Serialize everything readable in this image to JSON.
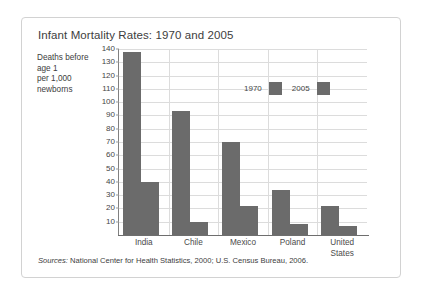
{
  "figure": {
    "title": "Infant Mortality Rates: 1970 and 2005",
    "axis_label_lines": [
      "Deaths before",
      "age 1",
      "per 1,000",
      "newborns"
    ],
    "sources": {
      "label": "Sources:",
      "text": " National Center for Health Statistics, 2000; U.S. Census Bureau, 2006."
    },
    "colors": {
      "bar_fill": "#6b6b6b",
      "gridline": "#dcdcdc",
      "axis_line": "#6e6e6e",
      "frame_border": "#d2d2d2",
      "text": "#3d3d3d"
    }
  },
  "chart_data": {
    "type": "bar",
    "title": "Infant Mortality Rates: 1970 and 2005",
    "xlabel": "",
    "ylabel": "Deaths before age 1 per 1,000 newborns",
    "categories": [
      "India",
      "Chile",
      "Mexico",
      "Poland",
      "United States"
    ],
    "category_display": [
      "India",
      "Chile",
      "Mexico",
      "Poland",
      "United\nStates"
    ],
    "series": [
      {
        "name": "1970",
        "values": [
          138,
          93,
          70,
          34,
          22
        ],
        "color": "#6b6b6b"
      },
      {
        "name": "2005",
        "values": [
          40,
          10,
          22,
          8,
          7
        ],
        "color": "#6b6b6b"
      }
    ],
    "ylim": [
      0,
      140
    ],
    "ytick_values": [
      10,
      20,
      30,
      40,
      50,
      60,
      70,
      80,
      90,
      100,
      110,
      120,
      130,
      140
    ],
    "ytick_labels": [
      "10",
      "20",
      "30",
      "40",
      "50",
      "60",
      "70",
      "80",
      "90",
      "100",
      "110",
      "120",
      "130",
      "140"
    ],
    "grid": true,
    "legend_position": "inside-top-right",
    "legend_entries": [
      "1970",
      "2005"
    ]
  }
}
